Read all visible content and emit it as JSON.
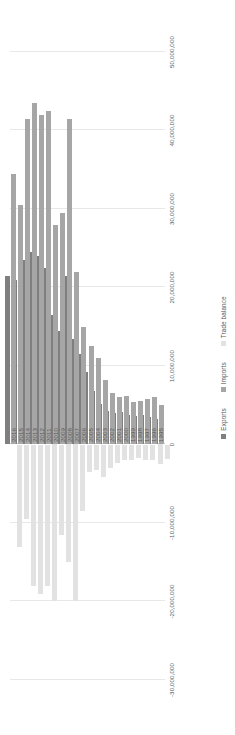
{
  "chart_data": {
    "type": "bar",
    "orientation": "horizontal",
    "title": "",
    "xlabel": "",
    "ylabel": "",
    "grid": true,
    "legend_position": "bottom",
    "axis_ticks": [
      "50,000,000",
      "40,000,000",
      "30,000,000",
      "20,000,000",
      "10,000,000",
      "0",
      "-10,000,000",
      "-20,000,000",
      "-30,000,000"
    ],
    "axis_tick_values": [
      50000000,
      40000000,
      30000000,
      20000000,
      10000000,
      0,
      -10000000,
      -20000000,
      -30000000
    ],
    "xlim": [
      -30000000,
      50000000
    ],
    "categories": [
      "1995",
      "1996",
      "1997",
      "1998",
      "1999",
      "2000",
      "2001",
      "2002",
      "2003",
      "2004",
      "2005",
      "2006",
      "2007",
      "2008",
      "2009",
      "2010",
      "2011",
      "2012",
      "2013",
      "2014",
      "2015",
      "2016"
    ],
    "series": [
      {
        "name": "Exports",
        "color": "#7f7f7f",
        "values": [
          3200000,
          3500000,
          3800000,
          3600000,
          3700000,
          4200000,
          4000000,
          4300000,
          5200000,
          6800000,
          9200000,
          11500000,
          13500000,
          21500000,
          14500000,
          16500000,
          22500000,
          24000000,
          24500000,
          23500000,
          21000000,
          21500000
        ]
      },
      {
        "name": "Imports",
        "color": "#a6a6a6",
        "values": [
          5000000,
          6000000,
          5800000,
          5600000,
          5400000,
          6200000,
          6000000,
          6600000,
          8200000,
          11000000,
          12500000,
          15000000,
          22000000,
          41500000,
          29500000,
          28000000,
          42500000,
          42000000,
          43500000,
          41500000,
          30500000,
          34500000
        ]
      },
      {
        "name": "Trade balance",
        "color": "#e2e2e2",
        "values": [
          -1800000,
          -2500000,
          -2000000,
          -2000000,
          -1700000,
          -2000000,
          -2000000,
          -2300000,
          -3000000,
          -4200000,
          -3300000,
          -3500000,
          -8500000,
          -20000000,
          -15000000,
          -11500000,
          -20000000,
          -18000000,
          -19000000,
          -18000000,
          -9500000,
          -13000000
        ]
      }
    ]
  },
  "legend": {
    "items": [
      {
        "label": "Exports"
      },
      {
        "label": "Imports"
      },
      {
        "label": "Trade balance"
      }
    ]
  }
}
